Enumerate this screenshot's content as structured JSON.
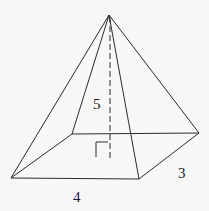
{
  "diagram": {
    "type": "square-based pyramid",
    "labels": {
      "height": "5",
      "base_length": "4",
      "base_width": "3"
    },
    "vertices": {
      "apex": [
        109,
        15
      ],
      "front_left": [
        11,
        178
      ],
      "front_right": [
        139,
        179
      ],
      "back_right": [
        199,
        133
      ],
      "back_left": [
        72,
        134
      ],
      "height_foot": [
        110,
        158
      ]
    },
    "right_angle_marker": true,
    "colors": {
      "line": "#2a2a2a",
      "background": "#f7f7f5"
    }
  }
}
